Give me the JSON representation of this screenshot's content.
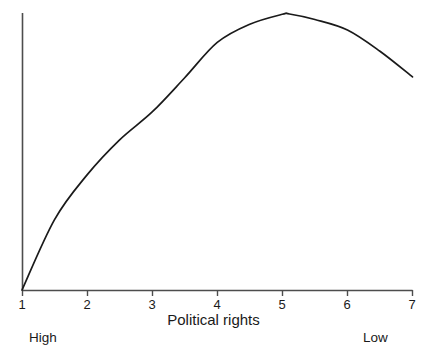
{
  "chart_data": {
    "type": "line",
    "title": "",
    "subtitle": "",
    "xlabel": "Political rights",
    "ylabel": "",
    "xlim": [
      1,
      7
    ],
    "ylim": [
      0,
      1
    ],
    "grid": false,
    "legend": null,
    "x_tick_labels": [
      "1",
      "2",
      "3",
      "4",
      "5",
      "6",
      "7"
    ],
    "x_ticks": [
      1,
      2,
      3,
      4,
      5,
      6,
      7
    ],
    "y_tick_labels": [],
    "x_axis_anchor_labels": {
      "left": "High",
      "right": "Low"
    },
    "series": [
      {
        "name": "",
        "color": "#1a1a1a",
        "x": [
          1,
          1.5,
          2,
          2.5,
          3,
          3.5,
          4,
          4.5,
          5,
          5.11,
          5.5,
          6,
          6.5,
          7
        ],
        "y": [
          0.0,
          0.255,
          0.417,
          0.544,
          0.645,
          0.769,
          0.897,
          0.963,
          0.999,
          1.0,
          0.98,
          0.942,
          0.865,
          0.772
        ]
      }
    ],
    "annotations": [
      {
        "text": "Political rights",
        "role": "x-axis-title",
        "x": 4
      },
      {
        "text": "High",
        "role": "x-axis-low-end-anchor",
        "x": 1
      },
      {
        "text": "Low",
        "role": "x-axis-high-end-anchor",
        "x": 7
      }
    ]
  },
  "axis": {
    "tick_labels": [
      "1",
      "2",
      "3",
      "4",
      "5",
      "6",
      "7"
    ],
    "title": "Political rights",
    "anchor_left": "High",
    "anchor_right": "Low"
  },
  "colors": {
    "background": "#ffffff",
    "axis": "#4d4d4d",
    "curve": "#1a1a1a",
    "text": "#1a1a1a"
  }
}
